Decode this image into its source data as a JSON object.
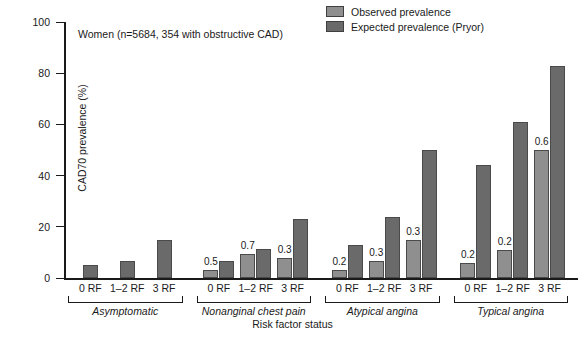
{
  "chart_data": {
    "type": "bar",
    "title": "",
    "annotation": "Women (n=5684, 354 with obstructive CAD)",
    "xlabel": "Risk factor status",
    "ylabel": "CAD70 prevalence (%)",
    "ylim": [
      0,
      100
    ],
    "yticks": [
      0,
      20,
      40,
      60,
      80,
      100
    ],
    "grid": false,
    "legend_position": "top-right",
    "categories": [
      "0 RF",
      "1–2 RF",
      "3 RF"
    ],
    "groups": [
      {
        "name": "Asymptomatic",
        "bars": [
          {
            "category": "0 RF",
            "observed": null,
            "expected": 5.0,
            "observed_label": "",
            "p_label": ""
          },
          {
            "category": "1–2 RF",
            "observed": null,
            "expected": 6.5,
            "observed_label": "",
            "p_label": ""
          },
          {
            "category": "3 RF",
            "observed": null,
            "expected": 15.0,
            "observed_label": "",
            "p_label": ""
          }
        ]
      },
      {
        "name": "Nonanginal chest pain",
        "bars": [
          {
            "category": "0 RF",
            "observed": 3.0,
            "expected": 6.5,
            "observed_label": "0.5",
            "p_label": "0.5"
          },
          {
            "category": "1–2 RF",
            "observed": 9.5,
            "expected": 11.5,
            "observed_label": "0.7",
            "p_label": "0.7"
          },
          {
            "category": "3 RF",
            "observed": 8.0,
            "expected": 23.0,
            "observed_label": "0.3",
            "p_label": "0.3"
          }
        ]
      },
      {
        "name": "Atypical angina",
        "bars": [
          {
            "category": "0 RF",
            "observed": 3.0,
            "expected": 13.0,
            "observed_label": "0.2",
            "p_label": "0.2"
          },
          {
            "category": "1–2 RF",
            "observed": 6.5,
            "expected": 24.0,
            "observed_label": "0.3",
            "p_label": "0.3"
          },
          {
            "category": "3 RF",
            "observed": 15.0,
            "expected": 50.0,
            "observed_label": "0.3",
            "p_label": "0.3"
          }
        ]
      },
      {
        "name": "Typical angina",
        "bars": [
          {
            "category": "0 RF",
            "observed": 6.0,
            "expected": 44.0,
            "observed_label": "0.2",
            "p_label": "0.2"
          },
          {
            "category": "1–2 RF",
            "observed": 11.0,
            "expected": 61.0,
            "observed_label": "0.2",
            "p_label": "0.2"
          },
          {
            "category": "3 RF",
            "observed": 50.0,
            "expected": 83.0,
            "observed_label": "0.6",
            "p_label": "0.6"
          }
        ]
      }
    ],
    "series": [
      {
        "name": "Observed prevalence",
        "color": "#8f8f8f"
      },
      {
        "name": "Expected prevalence (Pryor)",
        "color": "#6a6a6a"
      }
    ],
    "colors": {
      "observed": "#8f8f8f",
      "expected": "#6a6a6a",
      "axis": "#1a1a1a",
      "background": "#ffffff"
    }
  }
}
